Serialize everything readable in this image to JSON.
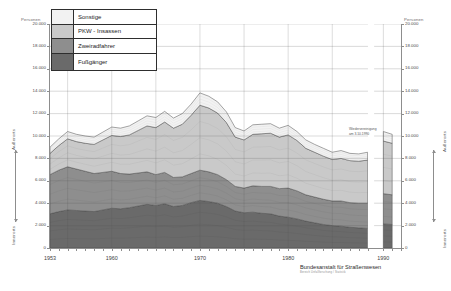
{
  "axes": {
    "left_unit": "Personen",
    "right_unit": "Personen",
    "y_ticks": [
      "20.000",
      "18.000",
      "16.000",
      "14.000",
      "12.000",
      "10.000",
      "8.000",
      "6.000",
      "4.000",
      "2.000",
      "0"
    ],
    "y_values": [
      20000,
      18000,
      16000,
      14000,
      12000,
      10000,
      8000,
      6000,
      4000,
      2000,
      0
    ],
    "x_ticks": [
      "1953",
      "1960",
      "1970",
      "1980",
      "1990"
    ],
    "x_values": [
      1953,
      1960,
      1970,
      1980,
      1990
    ],
    "side_caption_inner": "Innerorts",
    "side_caption_outer": "Außerorts"
  },
  "legend": {
    "items": [
      {
        "label": "Sonstige",
        "color": "#f2f2f2"
      },
      {
        "label": "PKW - Insassen",
        "color": "#c9c9c9"
      },
      {
        "label": "Zweiradfahrer",
        "color": "#8e8e8e"
      },
      {
        "label": "Fußgänger",
        "color": "#6a6a6a"
      }
    ]
  },
  "annotation": {
    "line1": "Wiedervereinigung",
    "line2": "am 3.10.1990"
  },
  "footer": {
    "organisation": "Bundesanstalt für Straßenwesen",
    "subline": "Bereich Unfallforschung / Statistik"
  },
  "chart_data": {
    "type": "area",
    "title": "",
    "xlabel": "",
    "ylabel": "Personen",
    "ylim": [
      0,
      20000
    ],
    "xlim": [
      1953,
      1992
    ],
    "grid": true,
    "legend_position": "top-left",
    "stacked": true,
    "x": [
      1953,
      1954,
      1955,
      1956,
      1957,
      1958,
      1959,
      1960,
      1961,
      1962,
      1963,
      1964,
      1965,
      1966,
      1967,
      1968,
      1969,
      1970,
      1971,
      1972,
      1973,
      1974,
      1975,
      1976,
      1977,
      1978,
      1979,
      1980,
      1981,
      1982,
      1983,
      1984,
      1985,
      1986,
      1987,
      1988,
      1989,
      1990,
      1991
    ],
    "series": [
      {
        "name": "Fußgänger",
        "color": "#6a6a6a",
        "values": [
          3050,
          3250,
          3400,
          3350,
          3300,
          3250,
          3400,
          3550,
          3500,
          3600,
          3750,
          3900,
          3800,
          3950,
          3700,
          3800,
          4050,
          4250,
          4150,
          4000,
          3700,
          3300,
          3150,
          3200,
          3100,
          3050,
          2850,
          2750,
          2600,
          2400,
          2250,
          2100,
          2000,
          1950,
          1850,
          1800,
          1750,
          2150,
          2100
        ]
      },
      {
        "name": "Zweiradfahrer",
        "color": "#8e8e8e",
        "values": [
          3500,
          3700,
          3850,
          3700,
          3550,
          3400,
          3350,
          3300,
          3150,
          3000,
          2950,
          2900,
          2750,
          2800,
          2600,
          2550,
          2600,
          2700,
          2650,
          2550,
          2400,
          2200,
          2200,
          2350,
          2400,
          2450,
          2450,
          2600,
          2500,
          2350,
          2300,
          2250,
          2200,
          2250,
          2200,
          2200,
          2250,
          2700,
          2650
        ]
      },
      {
        "name": "PKW - Insassen",
        "color": "#c9c9c9",
        "values": [
          1900,
          2200,
          2500,
          2450,
          2500,
          2600,
          2900,
          3200,
          3300,
          3500,
          3800,
          4100,
          4200,
          4500,
          4400,
          4700,
          5200,
          5800,
          5700,
          5500,
          5100,
          4400,
          4300,
          4600,
          4700,
          4750,
          4600,
          4750,
          4500,
          4150,
          4000,
          3850,
          3700,
          3800,
          3750,
          3750,
          3850,
          4700,
          4600
        ]
      },
      {
        "name": "Sonstige",
        "color": "#f2f2f2",
        "values": [
          550,
          600,
          650,
          650,
          650,
          650,
          700,
          750,
          750,
          800,
          850,
          900,
          900,
          950,
          900,
          950,
          1000,
          1100,
          1050,
          1000,
          950,
          850,
          800,
          850,
          850,
          850,
          800,
          850,
          800,
          750,
          700,
          700,
          650,
          700,
          650,
          650,
          700,
          850,
          800
        ]
      }
    ],
    "totals": [
      9000,
      9750,
      10400,
      10150,
      10000,
      9900,
      10350,
      10800,
      10700,
      10900,
      11350,
      11800,
      11650,
      12200,
      11600,
      12000,
      12850,
      13850,
      13550,
      13050,
      12150,
      10750,
      10450,
      11000,
      11050,
      11100,
      10700,
      10950,
      10400,
      9650,
      9250,
      8900,
      8550,
      8700,
      8450,
      8400,
      8550,
      10400,
      10150
    ],
    "break": {
      "after_x": 1989,
      "note": "Datenlücke / Wiedervereinigung"
    }
  }
}
